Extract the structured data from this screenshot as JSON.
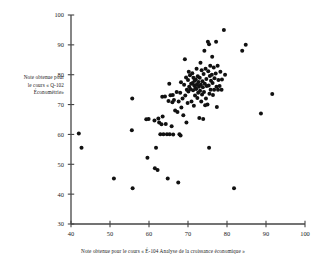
{
  "chart_data": {
    "type": "scatter",
    "title": "",
    "xlabel": "Note obtenue pour le cours « É-104 Analyse de la croissance économique »",
    "ylabel_lines": [
      "Note obtenue pour",
      "le cours « Q-102",
      "Économétrie»"
    ],
    "xlim": [
      40,
      100
    ],
    "ylim": [
      30,
      100
    ],
    "xticks": [
      40,
      50,
      60,
      70,
      80,
      90,
      100
    ],
    "yticks": [
      30,
      40,
      50,
      60,
      70,
      80,
      90,
      100
    ],
    "grid": false,
    "legend": null,
    "marker": {
      "shape": "circle",
      "color": "#111111",
      "size": 2.0
    },
    "axis_color": "#444444",
    "background": "#ffffff",
    "n_points": 132,
    "points": [
      [
        42.0,
        60.3
      ],
      [
        42.7,
        55.5
      ],
      [
        51.0,
        45.2
      ],
      [
        55.7,
        72.0
      ],
      [
        55.6,
        61.4
      ],
      [
        55.8,
        42.0
      ],
      [
        59.3,
        65.1
      ],
      [
        59.9,
        65.2
      ],
      [
        59.6,
        52.2
      ],
      [
        61.4,
        64.7
      ],
      [
        61.8,
        55.5
      ],
      [
        61.5,
        48.7
      ],
      [
        62.4,
        65.3
      ],
      [
        62.6,
        64.0
      ],
      [
        62.9,
        60.1
      ],
      [
        62.2,
        48.1
      ],
      [
        63.5,
        66.0
      ],
      [
        63.2,
        63.4
      ],
      [
        63.7,
        60.1
      ],
      [
        63.4,
        72.6
      ],
      [
        64.1,
        72.7
      ],
      [
        64.3,
        63.5
      ],
      [
        64.6,
        60.1
      ],
      [
        64.8,
        45.2
      ],
      [
        65.2,
        77.0
      ],
      [
        65.5,
        73.1
      ],
      [
        65.0,
        71.2
      ],
      [
        65.8,
        62.7
      ],
      [
        65.3,
        60.1
      ],
      [
        66.1,
        73.2
      ],
      [
        66.4,
        71.5
      ],
      [
        66.0,
        70.8
      ],
      [
        66.7,
        68.0
      ],
      [
        66.2,
        60.0
      ],
      [
        67.1,
        74.2
      ],
      [
        67.6,
        71.0
      ],
      [
        67.3,
        67.5
      ],
      [
        67.8,
        60.1
      ],
      [
        67.5,
        43.9
      ],
      [
        68.2,
        77.5
      ],
      [
        68.0,
        74.0
      ],
      [
        68.6,
        72.0
      ],
      [
        68.3,
        69.0
      ],
      [
        68.8,
        66.4
      ],
      [
        68.1,
        59.6
      ],
      [
        69.2,
        85.2
      ],
      [
        69.5,
        79.1
      ],
      [
        69.0,
        76.6
      ],
      [
        69.7,
        75.0
      ],
      [
        69.3,
        73.0
      ],
      [
        69.9,
        70.5
      ],
      [
        69.6,
        64.0
      ],
      [
        70.2,
        81.0
      ],
      [
        70.5,
        79.8
      ],
      [
        70.0,
        78.2
      ],
      [
        70.8,
        77.0
      ],
      [
        70.3,
        76.0
      ],
      [
        70.6,
        75.2
      ],
      [
        70.1,
        74.4
      ],
      [
        70.9,
        71.0
      ],
      [
        71.1,
        80.5
      ],
      [
        71.4,
        79.0
      ],
      [
        71.7,
        78.0
      ],
      [
        71.2,
        77.2
      ],
      [
        71.6,
        76.4
      ],
      [
        71.9,
        75.6
      ],
      [
        71.3,
        74.8
      ],
      [
        71.8,
        73.0
      ],
      [
        71.5,
        69.6
      ],
      [
        72.2,
        82.0
      ],
      [
        72.5,
        79.5
      ],
      [
        72.0,
        78.4
      ],
      [
        72.7,
        77.6
      ],
      [
        72.3,
        76.8
      ],
      [
        72.8,
        76.0
      ],
      [
        72.1,
        75.2
      ],
      [
        72.6,
        74.0
      ],
      [
        72.4,
        72.2
      ],
      [
        72.9,
        65.5
      ],
      [
        73.2,
        84.0
      ],
      [
        73.5,
        81.5
      ],
      [
        73.0,
        79.0
      ],
      [
        73.7,
        77.8
      ],
      [
        73.3,
        76.6
      ],
      [
        73.8,
        75.8
      ],
      [
        73.1,
        74.6
      ],
      [
        73.6,
        73.4
      ],
      [
        73.4,
        71.0
      ],
      [
        73.9,
        65.2
      ],
      [
        74.2,
        88.0
      ],
      [
        74.5,
        82.0
      ],
      [
        74.0,
        80.2
      ],
      [
        74.7,
        78.6
      ],
      [
        74.3,
        77.0
      ],
      [
        74.8,
        76.2
      ],
      [
        74.1,
        74.2
      ],
      [
        74.6,
        72.0
      ],
      [
        74.4,
        69.8
      ],
      [
        75.1,
        91.0
      ],
      [
        75.4,
        90.2
      ],
      [
        75.7,
        83.0
      ],
      [
        75.2,
        81.2
      ],
      [
        75.6,
        79.6
      ],
      [
        75.9,
        78.0
      ],
      [
        75.3,
        76.4
      ],
      [
        75.8,
        75.0
      ],
      [
        75.5,
        73.6
      ],
      [
        75.0,
        70.0
      ],
      [
        75.4,
        55.5
      ],
      [
        76.2,
        86.0
      ],
      [
        76.6,
        82.4
      ],
      [
        76.1,
        80.0
      ],
      [
        76.8,
        78.8
      ],
      [
        76.3,
        77.2
      ],
      [
        76.7,
        75.0
      ],
      [
        76.4,
        73.2
      ],
      [
        77.2,
        91.0
      ],
      [
        77.6,
        83.0
      ],
      [
        77.1,
        80.4
      ],
      [
        77.8,
        78.2
      ],
      [
        77.3,
        76.0
      ],
      [
        77.7,
        75.0
      ],
      [
        77.4,
        69.2
      ],
      [
        78.3,
        81.0
      ],
      [
        78.7,
        78.4
      ],
      [
        78.1,
        76.2
      ],
      [
        78.6,
        75.0
      ],
      [
        79.2,
        95.0
      ],
      [
        79.5,
        80.0
      ],
      [
        81.8,
        42.0
      ],
      [
        83.9,
        88.0
      ],
      [
        84.8,
        90.0
      ],
      [
        88.7,
        67.0
      ],
      [
        91.6,
        73.5
      ]
    ]
  }
}
